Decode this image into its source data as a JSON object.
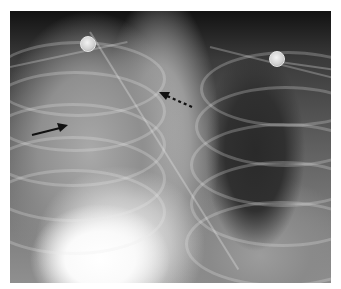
{
  "figure": {
    "panel_label": "a",
    "image_type": "chest radiograph",
    "annotations": [
      {
        "name": "solid-arrow",
        "style": "solid",
        "from": [
          32,
          135
        ],
        "to": [
          67,
          126
        ],
        "color": "#111111"
      },
      {
        "name": "dashed-arrow",
        "style": "dashed",
        "from": [
          192,
          107
        ],
        "to": [
          160,
          93
        ],
        "color": "#111111"
      }
    ],
    "markers": [
      {
        "name": "ecg-electrode-left",
        "center": [
          87,
          43
        ],
        "radius": 7
      },
      {
        "name": "ecg-electrode-right",
        "center": [
          276,
          58
        ],
        "radius": 7
      }
    ]
  }
}
